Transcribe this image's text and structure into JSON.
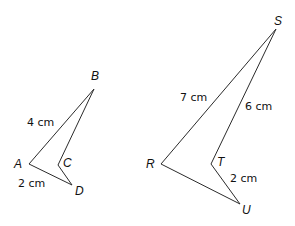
{
  "figures": [
    {
      "name": "quadrilateral-ABCD",
      "vertices": {
        "A": {
          "label": "A",
          "x": 29,
          "y": 164,
          "lx": 14,
          "ly": 168
        },
        "B": {
          "label": "B",
          "x": 94,
          "y": 89,
          "lx": 91,
          "ly": 80
        },
        "C": {
          "label": "C",
          "x": 58,
          "y": 165,
          "lx": 63,
          "ly": 167
        },
        "D": {
          "label": "D",
          "x": 72,
          "y": 185,
          "lx": 75,
          "ly": 195
        }
      },
      "lengths": [
        {
          "side": "AB",
          "text": "4 cm",
          "x": 27,
          "y": 126
        },
        {
          "side": "AD",
          "text": "2 cm",
          "x": 18,
          "y": 187
        }
      ]
    },
    {
      "name": "quadrilateral-RSTU",
      "vertices": {
        "R": {
          "label": "R",
          "x": 161,
          "y": 164,
          "lx": 146,
          "ly": 168
        },
        "S": {
          "label": "S",
          "x": 276,
          "y": 29,
          "lx": 274,
          "ly": 25
        },
        "T": {
          "label": "T",
          "x": 211,
          "y": 164,
          "lx": 217,
          "ly": 166
        },
        "U": {
          "label": "U",
          "x": 240,
          "y": 204,
          "lx": 242,
          "ly": 214
        }
      },
      "lengths": [
        {
          "side": "RS",
          "text": "7 cm",
          "x": 180,
          "y": 101
        },
        {
          "side": "ST",
          "text": "6 cm",
          "x": 245,
          "y": 110
        },
        {
          "side": "TU",
          "text": "2 cm",
          "x": 230,
          "y": 182
        }
      ]
    }
  ]
}
